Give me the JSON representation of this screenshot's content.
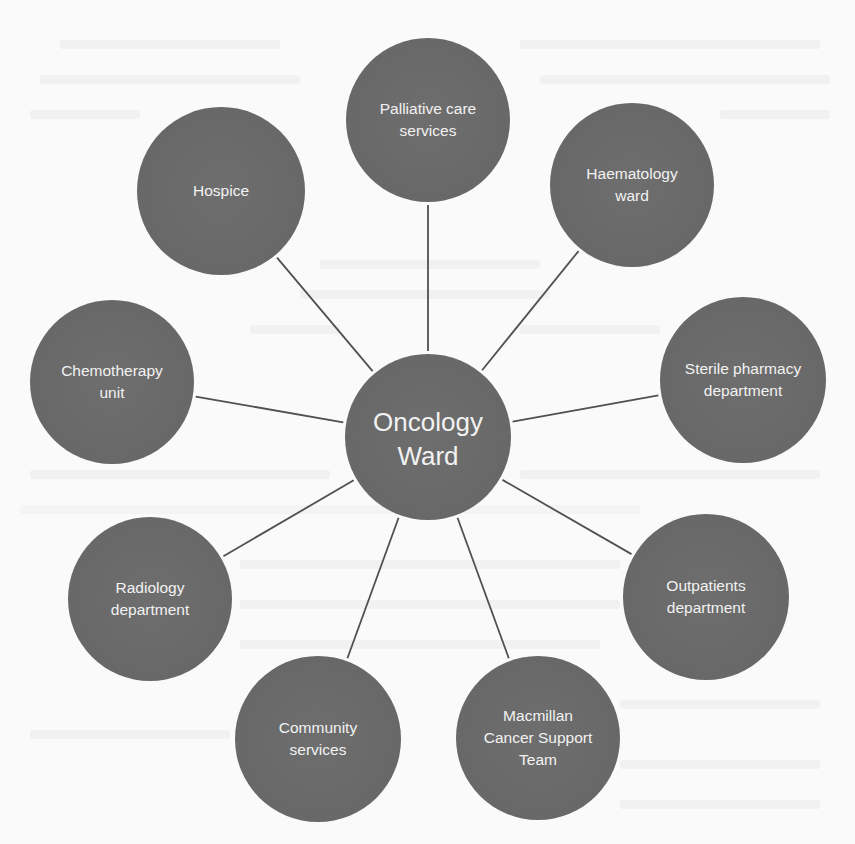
{
  "diagram": {
    "type": "hub-and-spoke",
    "colors": {
      "background": "#fafafa",
      "node_fill": "#6a6a6a",
      "node_text": "#f2f2f2",
      "connector": "#505050"
    },
    "hub": {
      "label": "Oncology\nWard",
      "cx": 428,
      "cy": 437,
      "r": 83
    },
    "nodes": [
      {
        "id": "palliative",
        "label": "Palliative care\nservices",
        "cx": 428,
        "cy": 120,
        "r": 82
      },
      {
        "id": "haematology",
        "label": "Haematology\nward",
        "cx": 632,
        "cy": 185,
        "r": 82
      },
      {
        "id": "sterile",
        "label": "Sterile pharmacy\ndepartment",
        "cx": 743,
        "cy": 380,
        "r": 83
      },
      {
        "id": "outpatients",
        "label": "Outpatients\ndepartment",
        "cx": 706,
        "cy": 597,
        "r": 83
      },
      {
        "id": "macmillan",
        "label": "Macmillan\nCancer Support\nTeam",
        "cx": 538,
        "cy": 738,
        "r": 82
      },
      {
        "id": "community",
        "label": "Community\nservices",
        "cx": 318,
        "cy": 739,
        "r": 83
      },
      {
        "id": "radiology",
        "label": "Radiology\ndepartment",
        "cx": 150,
        "cy": 599,
        "r": 82
      },
      {
        "id": "chemotherapy",
        "label": "Chemotherapy\nunit",
        "cx": 112,
        "cy": 382,
        "r": 82
      },
      {
        "id": "hospice",
        "label": "Hospice",
        "cx": 221,
        "cy": 191,
        "r": 84
      }
    ]
  }
}
